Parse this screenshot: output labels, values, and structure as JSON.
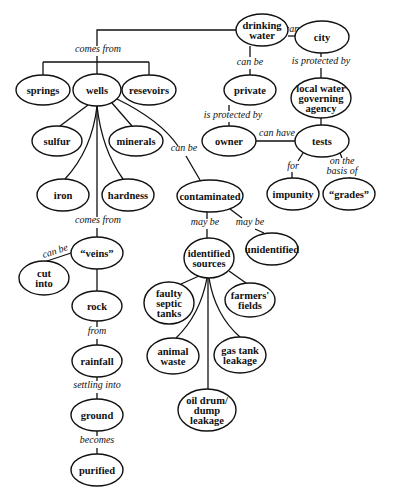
{
  "diagram": {
    "type": "concept-map",
    "nodes": [
      {
        "id": "drinking_water",
        "lines": [
          "drinking",
          "water"
        ],
        "cx": 262,
        "cy": 30,
        "rx": 26,
        "ry": 16
      },
      {
        "id": "city",
        "lines": [
          "city"
        ],
        "cx": 322,
        "cy": 37,
        "rx": 27,
        "ry": 16
      },
      {
        "id": "private",
        "lines": [
          "private"
        ],
        "cx": 250,
        "cy": 90,
        "rx": 26,
        "ry": 15
      },
      {
        "id": "local_water_agency",
        "lines": [
          "local water",
          "governing",
          "agency"
        ],
        "cx": 321,
        "cy": 98,
        "rx": 30,
        "ry": 20
      },
      {
        "id": "owner",
        "lines": [
          "owner"
        ],
        "cx": 229,
        "cy": 141,
        "rx": 27,
        "ry": 15
      },
      {
        "id": "tests",
        "lines": [
          "tests"
        ],
        "cx": 322,
        "cy": 141,
        "rx": 27,
        "ry": 16
      },
      {
        "id": "impunity",
        "lines": [
          "impunity"
        ],
        "cx": 293,
        "cy": 194,
        "rx": 26,
        "ry": 16
      },
      {
        "id": "grades",
        "lines": [
          "“grades”"
        ],
        "cx": 349,
        "cy": 194,
        "rx": 26,
        "ry": 16
      },
      {
        "id": "springs",
        "lines": [
          "springs"
        ],
        "cx": 43,
        "cy": 90,
        "rx": 27,
        "ry": 15
      },
      {
        "id": "wells",
        "lines": [
          "wells"
        ],
        "cx": 97,
        "cy": 90,
        "rx": 24,
        "ry": 16
      },
      {
        "id": "resevoirs",
        "lines": [
          "resevoirs"
        ],
        "cx": 149,
        "cy": 90,
        "rx": 27,
        "ry": 15
      },
      {
        "id": "sulfur",
        "lines": [
          "sulfur"
        ],
        "cx": 57,
        "cy": 141,
        "rx": 25,
        "ry": 15
      },
      {
        "id": "minerals",
        "lines": [
          "minerals"
        ],
        "cx": 136,
        "cy": 141,
        "rx": 27,
        "ry": 15
      },
      {
        "id": "iron",
        "lines": [
          "iron"
        ],
        "cx": 63,
        "cy": 195,
        "rx": 26,
        "ry": 16
      },
      {
        "id": "hardness",
        "lines": [
          "hardness"
        ],
        "cx": 128,
        "cy": 195,
        "rx": 26,
        "ry": 16
      },
      {
        "id": "contaminated",
        "lines": [
          "contaminated"
        ],
        "cx": 210,
        "cy": 196,
        "rx": 33,
        "ry": 16
      },
      {
        "id": "identified_sources",
        "lines": [
          "identified",
          "sources"
        ],
        "cx": 209,
        "cy": 258,
        "rx": 25,
        "ry": 20
      },
      {
        "id": "unidentified",
        "lines": [
          "unidentified"
        ],
        "cx": 272,
        "cy": 249,
        "rx": 26,
        "ry": 16
      },
      {
        "id": "veins",
        "lines": [
          "“veins”"
        ],
        "cx": 97,
        "cy": 253,
        "rx": 26,
        "ry": 16
      },
      {
        "id": "cut_into",
        "lines": [
          "cut",
          "into"
        ],
        "cx": 44,
        "cy": 278,
        "rx": 25,
        "ry": 17
      },
      {
        "id": "rock",
        "lines": [
          "rock"
        ],
        "cx": 97,
        "cy": 306,
        "rx": 25,
        "ry": 15
      },
      {
        "id": "faulty_septic",
        "lines": [
          "faulty",
          "septic",
          "tanks"
        ],
        "cx": 169,
        "cy": 303,
        "rx": 25,
        "ry": 21
      },
      {
        "id": "farmers_fields",
        "lines": [
          "farmers'",
          "fields"
        ],
        "cx": 250,
        "cy": 300,
        "rx": 25,
        "ry": 17
      },
      {
        "id": "rainfall",
        "lines": [
          "rainfall"
        ],
        "cx": 97,
        "cy": 361,
        "rx": 25,
        "ry": 16
      },
      {
        "id": "animal_waste",
        "lines": [
          "animal",
          "waste"
        ],
        "cx": 173,
        "cy": 356,
        "rx": 26,
        "ry": 18
      },
      {
        "id": "gas_tank",
        "lines": [
          "gas tank",
          "leakage"
        ],
        "cx": 240,
        "cy": 355,
        "rx": 26,
        "ry": 18
      },
      {
        "id": "oil_drum",
        "lines": [
          "oil drum/",
          "dump",
          "leakage"
        ],
        "cx": 207,
        "cy": 410,
        "rx": 29,
        "ry": 21
      },
      {
        "id": "ground",
        "lines": [
          "ground"
        ],
        "cx": 97,
        "cy": 415,
        "rx": 26,
        "ry": 16
      },
      {
        "id": "purified",
        "lines": [
          "purified"
        ],
        "cx": 97,
        "cy": 470,
        "rx": 26,
        "ry": 16
      }
    ],
    "links": [
      {
        "label": "comes from",
        "x": 98,
        "y": 52
      },
      {
        "label": "can be",
        "x": 298,
        "y": 32
      },
      {
        "label": "can be",
        "x": 250,
        "y": 65
      },
      {
        "label": "is protected by",
        "x": 321,
        "y": 64
      },
      {
        "label": "is protected by",
        "x": 233,
        "y": 118
      },
      {
        "label": "can have",
        "x": 277,
        "y": 136
      },
      {
        "label": "for",
        "x": 293,
        "y": 169
      },
      {
        "label": "on the",
        "x": 342,
        "y": 164
      },
      {
        "label": "basis of",
        "x": 342,
        "y": 174
      },
      {
        "label": "can be",
        "x": 184,
        "y": 151
      },
      {
        "label": "comes from",
        "x": 98,
        "y": 223
      },
      {
        "label": "may be",
        "x": 205,
        "y": 225
      },
      {
        "label": "may be",
        "x": 250,
        "y": 225
      },
      {
        "label": "can be",
        "x": 56,
        "y": 254
      },
      {
        "label": "from",
        "x": 97,
        "y": 334
      },
      {
        "label": "settling into",
        "x": 97,
        "y": 388
      },
      {
        "label": "becomes",
        "x": 97,
        "y": 443
      }
    ]
  }
}
